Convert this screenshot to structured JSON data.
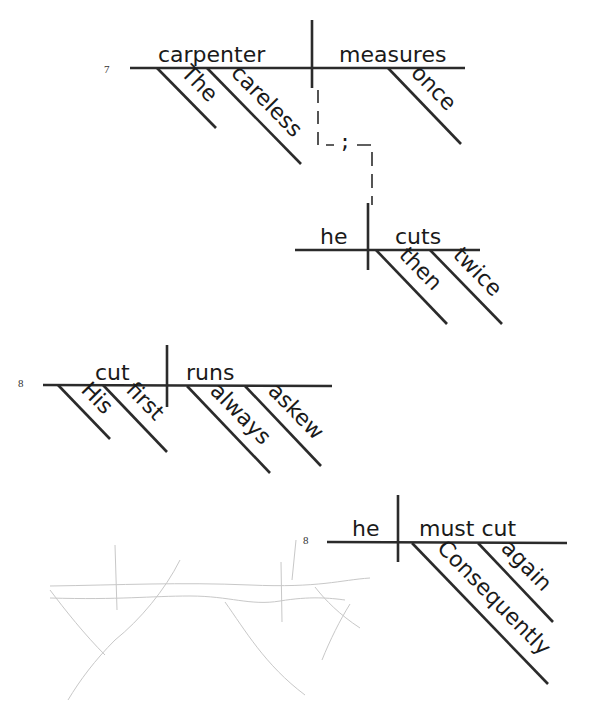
{
  "diagrams": [
    {
      "number": "7",
      "subject": "carpenter",
      "predicate": "measures",
      "subject_modifiers": [
        "The",
        "careless"
      ],
      "predicate_modifiers": [
        "once"
      ],
      "connector": ";",
      "joined_clause": {
        "subject": "he",
        "predicate": "cuts",
        "predicate_modifiers": [
          "then",
          "twice"
        ]
      }
    },
    {
      "number": "8",
      "subject": "cut",
      "predicate": "runs",
      "subject_modifiers": [
        "His",
        "first"
      ],
      "predicate_modifiers": [
        "always",
        "askew"
      ]
    },
    {
      "number": "8",
      "subject": "he",
      "predicate": "must cut",
      "predicate_modifiers": [
        "Consequently",
        "again"
      ]
    }
  ],
  "colors": {
    "ink": "#2b2b2b",
    "pencil": "#c8c8c8",
    "paper": "#ffffff"
  }
}
